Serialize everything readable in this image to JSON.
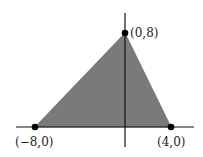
{
  "diagram": {
    "fill_color": "#7a7a7a",
    "axis_color": "#111111",
    "point_color": "#000000",
    "axes": {
      "x_axis": {
        "x1": 16,
        "y1": 127,
        "x2": 194,
        "y2": 127
      },
      "y_axis": {
        "x1": 125,
        "y1": 13,
        "x2": 125,
        "y2": 147
      }
    },
    "vertices": [
      {
        "label": "(0,8)",
        "x": 0,
        "y": 8,
        "px": 125,
        "py": 33,
        "label_x": 130,
        "label_y": 37
      },
      {
        "label": "(−8,0)",
        "x": -8,
        "y": 0,
        "px": 35,
        "py": 127,
        "label_x": 15,
        "label_y": 146
      },
      {
        "label": "(4,0)",
        "x": 4,
        "y": 0,
        "px": 171,
        "py": 127,
        "label_x": 157,
        "label_y": 146
      }
    ]
  }
}
